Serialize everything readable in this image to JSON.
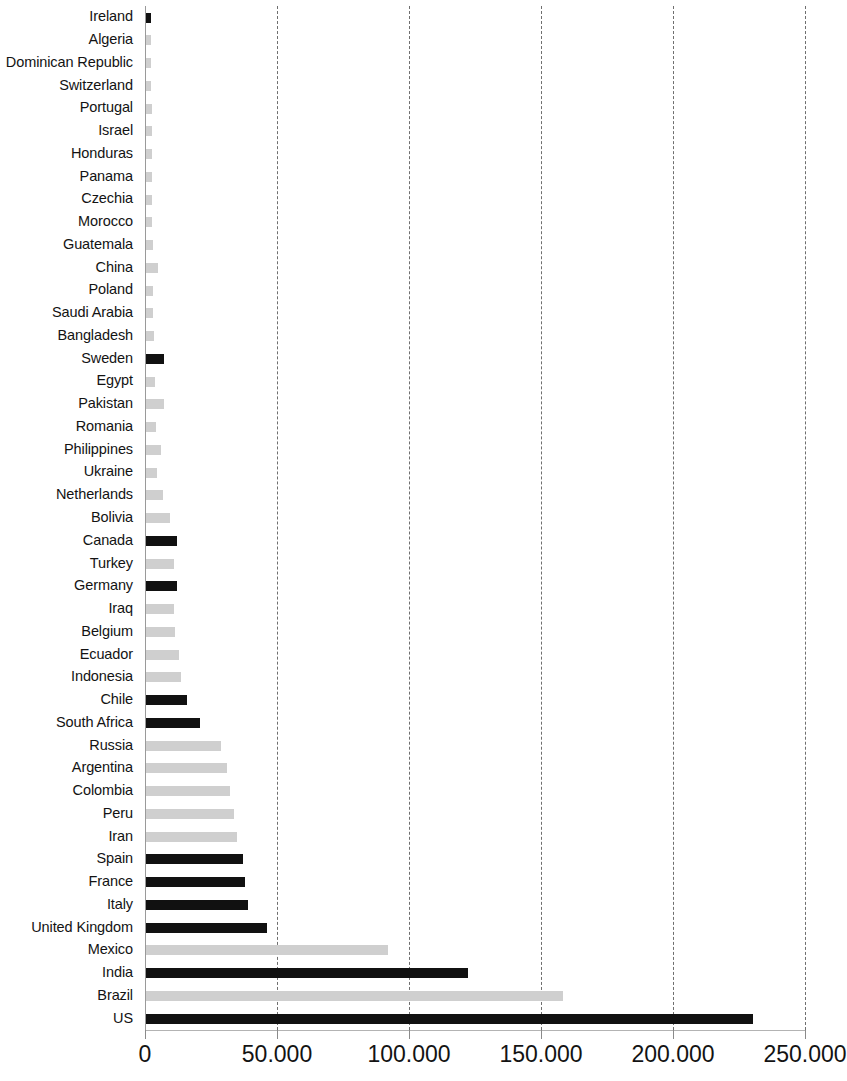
{
  "chart_data": {
    "type": "bar",
    "orientation": "horizontal",
    "title": "",
    "subtitle": "",
    "xlabel": "",
    "ylabel": "",
    "xlim": [
      0,
      250000
    ],
    "ylim": null,
    "grid": true,
    "grid_axis": "x",
    "grid_style": "dashed",
    "legend": null,
    "legend_position": "none",
    "axis_tick_labels": [
      "0",
      "50.000",
      "100.000",
      "150.000",
      "200.000",
      "250.000"
    ],
    "axis_tick_values": [
      0,
      50000,
      100000,
      150000,
      200000,
      250000
    ],
    "colors": {
      "dark_bar": "#111111",
      "light_bar": "#cfcfcf",
      "grid": "#6f6f6f",
      "axis": "#9a9a9a"
    },
    "categories": [
      "Ireland",
      "Algeria",
      "Dominican Republic",
      "Switzerland",
      "Portugal",
      "Israel",
      "Honduras",
      "Panama",
      "Czechia",
      "Morocco",
      "Guatemala",
      "China",
      "Poland",
      "Saudi Arabia",
      "Bangladesh",
      "Sweden",
      "Egypt",
      "Pakistan",
      "Romania",
      "Philippines",
      "Ukraine",
      "Netherlands",
      "Bolivia",
      "Canada",
      "Turkey",
      "Germany",
      "Iraq",
      "Belgium",
      "Ecuador",
      "Indonesia",
      "Chile",
      "South Africa",
      "Russia",
      "Argentina",
      "Colombia",
      "Peru",
      "Iran",
      "Spain",
      "France",
      "Italy",
      "United Kingdom",
      "Mexico",
      "India",
      "Brazil",
      "US"
    ],
    "values": [
      1800,
      1900,
      2000,
      2050,
      2100,
      2150,
      2250,
      2300,
      2350,
      2400,
      2500,
      4700,
      2700,
      2750,
      2900,
      6700,
      3400,
      6800,
      3700,
      5600,
      4300,
      6500,
      9200,
      11700,
      10700,
      11800,
      10700,
      10900,
      12400,
      13200,
      15500,
      20300,
      28500,
      30800,
      31800,
      33200,
      34500,
      36700,
      37500,
      38800,
      46000,
      91500,
      122000,
      158000,
      230000
    ],
    "bar_colors": [
      "dark",
      "light",
      "light",
      "light",
      "light",
      "light",
      "light",
      "light",
      "light",
      "light",
      "light",
      "light",
      "light",
      "light",
      "light",
      "dark",
      "light",
      "light",
      "light",
      "light",
      "light",
      "light",
      "light",
      "dark",
      "light",
      "dark",
      "light",
      "light",
      "light",
      "light",
      "dark",
      "dark",
      "light",
      "light",
      "light",
      "light",
      "light",
      "dark",
      "dark",
      "dark",
      "dark",
      "light",
      "dark",
      "light",
      "dark"
    ]
  }
}
